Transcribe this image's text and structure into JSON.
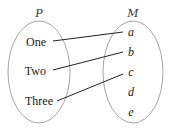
{
  "diagram": {
    "type": "set-mapping",
    "domain_set": {
      "name": "P",
      "elements": [
        "One",
        "Two",
        "Three"
      ]
    },
    "codomain_set": {
      "name": "M",
      "elements": [
        "a",
        "b",
        "c",
        "d",
        "e"
      ]
    },
    "mappings": [
      {
        "from": "One",
        "to": "a"
      },
      {
        "from": "Two",
        "to": "b"
      },
      {
        "from": "Three",
        "to": "c"
      }
    ],
    "colors": {
      "ellipse_stroke": "#999999",
      "line": "#222222",
      "text": "#222222"
    }
  }
}
